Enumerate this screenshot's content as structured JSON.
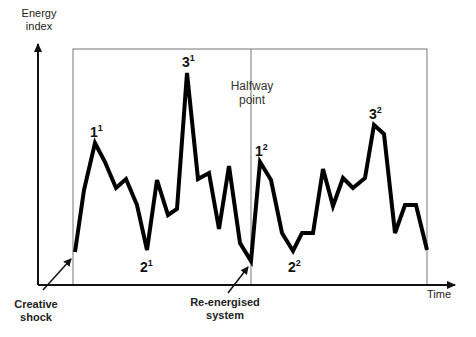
{
  "chart_data": {
    "type": "line",
    "title": "",
    "xlabel": "Time",
    "ylabel": "Energy index",
    "grid": false,
    "frame": {
      "left": 73,
      "top": 49,
      "right": 427,
      "bottom": 285
    },
    "halfway_x": 251,
    "series": [
      {
        "name": "Energy",
        "points": [
          [
            75,
            252
          ],
          [
            84,
            190
          ],
          [
            95,
            143
          ],
          [
            105,
            162
          ],
          [
            116,
            188
          ],
          [
            126,
            179
          ],
          [
            137,
            205
          ],
          [
            147,
            250
          ],
          [
            157,
            180
          ],
          [
            168,
            215
          ],
          [
            177,
            209
          ],
          [
            187,
            73
          ],
          [
            198,
            179
          ],
          [
            209,
            173
          ],
          [
            219,
            229
          ],
          [
            229,
            166
          ],
          [
            240,
            243
          ],
          [
            251,
            261
          ],
          [
            260,
            162
          ],
          [
            271,
            180
          ],
          [
            282,
            233
          ],
          [
            293,
            251
          ],
          [
            302,
            233
          ],
          [
            313,
            233
          ],
          [
            323,
            169
          ],
          [
            333,
            206
          ],
          [
            343,
            178
          ],
          [
            353,
            188
          ],
          [
            365,
            178
          ],
          [
            374,
            125
          ],
          [
            384,
            134
          ],
          [
            395,
            233
          ],
          [
            405,
            205
          ],
          [
            416,
            205
          ],
          [
            427,
            250
          ]
        ]
      }
    ]
  },
  "labels": {
    "y_axis": [
      "Energy",
      "index"
    ],
    "x_axis": "Time",
    "halfway": [
      "Halfway",
      "point"
    ],
    "creative_shock": [
      "Creative",
      "shock"
    ],
    "re_energised": [
      "Re-energised",
      "system"
    ],
    "peaks": [
      {
        "base": "1",
        "sup": "1",
        "x": 90,
        "y": 137
      },
      {
        "base": "2",
        "sup": "1",
        "x": 140,
        "y": 272
      },
      {
        "base": "3",
        "sup": "1",
        "x": 182,
        "y": 67
      },
      {
        "base": "1",
        "sup": "2",
        "x": 255,
        "y": 156
      },
      {
        "base": "2",
        "sup": "2",
        "x": 288,
        "y": 272
      },
      {
        "base": "3",
        "sup": "2",
        "x": 369,
        "y": 119
      }
    ]
  },
  "colors": {
    "line": "#000000",
    "frame": "#777777",
    "axis": "#111111",
    "text": "#222222"
  }
}
